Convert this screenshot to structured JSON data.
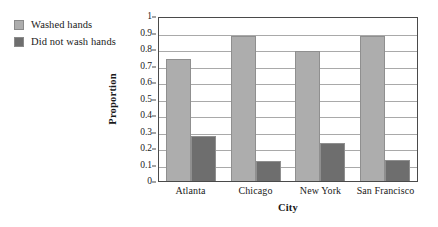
{
  "chart_data": {
    "type": "bar",
    "title": "",
    "subtitle": "",
    "xlabel": "City",
    "ylabel": "Proportion",
    "categories": [
      "Atlanta",
      "Chicago",
      "New York",
      "San Francisco"
    ],
    "series": [
      {
        "name": "Washed hands",
        "color": "#ADADAD",
        "values": [
          0.74,
          0.88,
          0.79,
          0.88
        ]
      },
      {
        "name": "Did not wash hands",
        "color": "#6E6E6E",
        "values": [
          0.27,
          0.12,
          0.23,
          0.13
        ]
      }
    ],
    "ylim": [
      0,
      1
    ],
    "ytick_labels": [
      "1",
      "0.9",
      "0.8",
      "0.7",
      "0.6",
      "0.5",
      "0.4",
      "0.3",
      "0.2",
      "0.1",
      "0"
    ],
    "ytick_values": [
      1,
      0.9,
      0.8,
      0.7,
      0.6,
      0.5,
      0.4,
      0.3,
      0.2,
      0.1,
      0
    ],
    "grid": "horizontal",
    "legend_position": "outside-top-left",
    "frame": true
  },
  "legend": {
    "items": [
      {
        "label": "Washed hands",
        "color": "#ADADAD"
      },
      {
        "label": "Did not wash hands",
        "color": "#6E6E6E"
      }
    ]
  },
  "axes": {
    "y_title": "Proportion",
    "x_title": "City"
  }
}
